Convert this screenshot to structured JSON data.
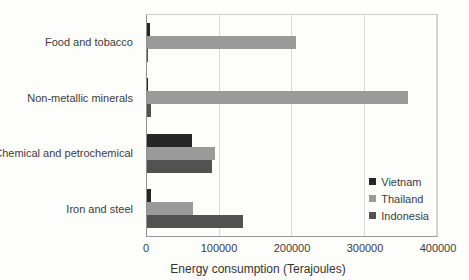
{
  "chart_data": {
    "type": "bar",
    "orientation": "horizontal",
    "title": "",
    "xlabel": "Energy consumption (Terajoules)",
    "ylabel": "",
    "categories": [
      "Food and tobacco",
      "Non-metallic minerals",
      "Chemical and petrochemical",
      "Iron and steel"
    ],
    "series": [
      {
        "name": "Vietnam",
        "color": "#262626",
        "values": [
          4000,
          1500,
          62000,
          6000
        ]
      },
      {
        "name": "Thailand",
        "color": "#9a9a9a",
        "values": [
          205000,
          360000,
          94000,
          63000
        ]
      },
      {
        "name": "Indonesia",
        "color": "#525252",
        "values": [
          2000,
          5000,
          89000,
          133000
        ]
      }
    ],
    "xlim": [
      0,
      400000
    ],
    "xticks": [
      0,
      100000,
      200000,
      300000,
      400000
    ],
    "xtick_labels": [
      "0",
      "100000",
      "200000",
      "300000",
      "400000"
    ],
    "grid": true,
    "legend_position": "inside-right",
    "legend": [
      "Vietnam",
      "Thailand",
      "Indonesia"
    ]
  },
  "colors": {
    "gridline": "#d9d9d9",
    "axis_line": "#9a9a9a",
    "plot_border": "#cccccc",
    "text": "#3c3c3c"
  }
}
